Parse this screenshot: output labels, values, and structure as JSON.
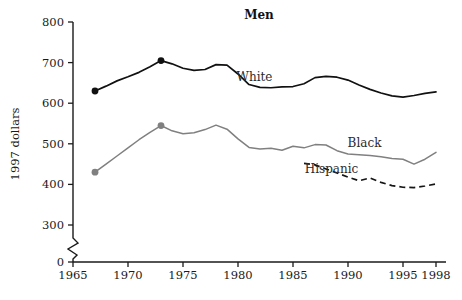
{
  "chart_data": {
    "type": "line",
    "title": "Men",
    "xlabel": "",
    "ylabel": "1997 dollars",
    "xlim": [
      1964,
      1999
    ],
    "ylim": [
      300,
      800
    ],
    "grid": false,
    "legend_position": "inline-labels",
    "axis_break": "y-axis broken between 0 and 300",
    "xticks": [
      1965,
      1970,
      1975,
      1980,
      1985,
      1990,
      1995,
      1998
    ],
    "xtick_labels": [
      "1965",
      "1970",
      "1975",
      "1980",
      "1985",
      "1990",
      "1995",
      "1998"
    ],
    "yticks": [
      0,
      300,
      400,
      500,
      600,
      700,
      800
    ],
    "ytick_labels": [
      "0",
      "300",
      "400",
      "500",
      "600",
      "700",
      "800"
    ],
    "series": [
      {
        "name": "White",
        "color": "#111111",
        "style": "solid",
        "label_x": 1981.5,
        "label_y": 655,
        "markers_at": [
          1967,
          1973
        ],
        "x": [
          1967,
          1968,
          1969,
          1970,
          1971,
          1972,
          1973,
          1974,
          1975,
          1976,
          1977,
          1978,
          1979,
          1980,
          1981,
          1982,
          1983,
          1984,
          1985,
          1986,
          1987,
          1988,
          1989,
          1990,
          1991,
          1992,
          1993,
          1994,
          1995,
          1996,
          1997,
          1998
        ],
        "y": [
          630,
          642,
          655,
          665,
          676,
          690,
          705,
          697,
          686,
          681,
          683,
          695,
          694,
          672,
          646,
          639,
          638,
          640,
          641,
          648,
          663,
          666,
          664,
          657,
          645,
          634,
          625,
          618,
          615,
          619,
          624,
          628
        ]
      },
      {
        "name": "Black",
        "color": "#808080",
        "style": "solid",
        "label_x": 1991.5,
        "label_y": 493,
        "markers_at": [
          1967,
          1973
        ],
        "x": [
          1967,
          1968,
          1969,
          1970,
          1971,
          1972,
          1973,
          1974,
          1975,
          1976,
          1977,
          1978,
          1979,
          1980,
          1981,
          1982,
          1983,
          1984,
          1985,
          1986,
          1987,
          1988,
          1989,
          1990,
          1991,
          1992,
          1993,
          1994,
          1995,
          1996,
          1997,
          1998
        ],
        "y": [
          430,
          450,
          470,
          490,
          510,
          528,
          545,
          532,
          525,
          527,
          535,
          546,
          536,
          512,
          491,
          487,
          489,
          484,
          494,
          490,
          498,
          497,
          483,
          475,
          473,
          471,
          468,
          464,
          462,
          450,
          462,
          479
        ]
      },
      {
        "name": "Hispanic",
        "color": "#151515",
        "style": "dashed",
        "label_x": 1988.5,
        "label_y": 428,
        "markers_at": [],
        "x": [
          1986,
          1987,
          1988,
          1989,
          1990,
          1991,
          1992,
          1993,
          1994,
          1995,
          1996,
          1997,
          1998
        ],
        "y": [
          452,
          448,
          438,
          428,
          418,
          409,
          416,
          405,
          397,
          393,
          392,
          396,
          401
        ]
      }
    ]
  }
}
